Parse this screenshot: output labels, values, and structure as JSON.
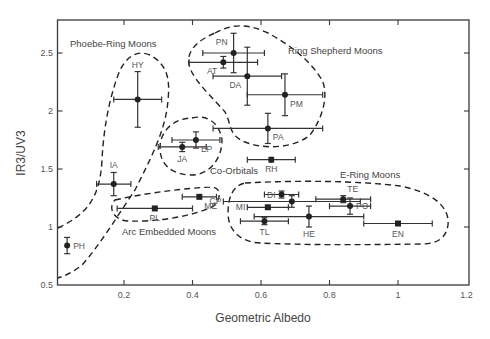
{
  "chart_data": {
    "type": "scatter",
    "title": "",
    "xlabel": "Geometric Albedo",
    "ylabel": "IR3/UV3",
    "xlim": [
      0.005,
      1.2
    ],
    "ylim": [
      0.5,
      2.78
    ],
    "xticks": [
      0.2,
      0.4,
      0.6,
      0.8,
      1,
      1.2
    ],
    "xtick_labels": [
      "0.2",
      "0.4",
      "0.6",
      "0.8",
      "1",
      "1.2"
    ],
    "yticks": [
      0.5,
      1,
      1.5,
      2,
      2.5
    ],
    "ytick_labels": [
      "0.5",
      "1",
      "1.5",
      "2",
      "2.5"
    ],
    "grid": false,
    "points": [
      {
        "label": "PH",
        "x": 0.034,
        "y": 0.84,
        "xerr": 0,
        "yerr": 0.07,
        "marker": "circle",
        "label_pos": "right"
      },
      {
        "label": "IA",
        "x": 0.17,
        "y": 1.37,
        "xerr": 0.05,
        "yerr": 0.1,
        "marker": "circle",
        "label_pos": "top"
      },
      {
        "label": "HY",
        "x": 0.24,
        "y": 2.1,
        "xerr": 0.07,
        "yerr": 0.24,
        "marker": "circle",
        "label_pos": "top"
      },
      {
        "label": "JA",
        "x": 0.37,
        "y": 1.69,
        "xerr": 0.07,
        "yerr": 0.04,
        "marker": "circle",
        "label_pos": "bottom"
      },
      {
        "label": "EP",
        "x": 0.41,
        "y": 1.75,
        "xerr": 0.07,
        "yerr": 0.07,
        "marker": "circle",
        "label_pos": "bottom-right"
      },
      {
        "label": "PL",
        "x": 0.29,
        "y": 1.16,
        "xerr": 0.11,
        "yerr": 0,
        "marker": "square",
        "label_pos": "bottom"
      },
      {
        "label": "ME",
        "x": 0.42,
        "y": 1.26,
        "xerr": 0.05,
        "yerr": 0,
        "marker": "square",
        "label_pos": "bottom-right"
      },
      {
        "label": "AT",
        "x": 0.49,
        "y": 2.42,
        "xerr": 0.1,
        "yerr": 0.05,
        "marker": "circle",
        "label_pos": "bottom-left"
      },
      {
        "label": "PN",
        "x": 0.52,
        "y": 2.5,
        "xerr": 0.09,
        "yerr": 0.17,
        "marker": "circle",
        "label_pos": "top-left"
      },
      {
        "label": "DA",
        "x": 0.56,
        "y": 2.3,
        "xerr": 0.1,
        "yerr": 0.25,
        "marker": "circle",
        "label_pos": "bottom-left"
      },
      {
        "label": "PM",
        "x": 0.67,
        "y": 2.14,
        "xerr": 0.11,
        "yerr": 0.18,
        "marker": "circle",
        "label_pos": "bottom-right"
      },
      {
        "label": "PA",
        "x": 0.62,
        "y": 1.85,
        "xerr": 0.16,
        "yerr": 0.13,
        "marker": "circle",
        "label_pos": "bottom-right"
      },
      {
        "label": "RH",
        "x": 0.63,
        "y": 1.58,
        "xerr": 0.07,
        "yerr": 0.02,
        "marker": "circle",
        "label_pos": "bottom"
      },
      {
        "label": "DI",
        "x": 0.66,
        "y": 1.28,
        "xerr": 0.05,
        "yerr": 0.03,
        "marker": "circle",
        "label_pos": "left"
      },
      {
        "label": "CP",
        "x": 0.69,
        "y": 1.22,
        "xerr": 0.2,
        "yerr": 0.05,
        "marker": "circle",
        "label_pos": "far-left"
      },
      {
        "label": "MI",
        "x": 0.62,
        "y": 1.17,
        "xerr": 0.06,
        "yerr": 0,
        "marker": "square",
        "label_pos": "far-left"
      },
      {
        "label": "TL",
        "x": 0.61,
        "y": 1.05,
        "xerr": 0.07,
        "yerr": 0.03,
        "marker": "circle",
        "label_pos": "bottom"
      },
      {
        "label": "HE",
        "x": 0.74,
        "y": 1.09,
        "xerr": 0.16,
        "yerr": 0.09,
        "marker": "circle",
        "label_pos": "bottom"
      },
      {
        "label": "TE",
        "x": 0.84,
        "y": 1.24,
        "xerr": 0.08,
        "yerr": 0.03,
        "marker": "circle",
        "label_pos": "top-right"
      },
      {
        "label": "PO",
        "x": 0.86,
        "y": 1.18,
        "xerr": 0.06,
        "yerr": 0.07,
        "marker": "circle",
        "label_pos": "right"
      },
      {
        "label": "EN",
        "x": 1.0,
        "y": 1.03,
        "xerr": 0.1,
        "yerr": 0,
        "marker": "square",
        "label_pos": "bottom"
      }
    ],
    "groups": [
      {
        "name": "Phoebe-Ring Moons",
        "members": [
          "PH",
          "IA",
          "HY"
        ]
      },
      {
        "name": "Ring Shepherd Moons",
        "members": [
          "AT",
          "PN",
          "DA",
          "PM",
          "PA"
        ]
      },
      {
        "name": "Co-Orbitals",
        "members": [
          "JA",
          "EP"
        ]
      },
      {
        "name": "Arc Embedded Moons",
        "members": [
          "PL",
          "ME"
        ]
      },
      {
        "name": "E-Ring Moons",
        "members": [
          "DI",
          "CP",
          "MI",
          "TL",
          "HE",
          "TE",
          "PO",
          "EN"
        ]
      }
    ]
  }
}
